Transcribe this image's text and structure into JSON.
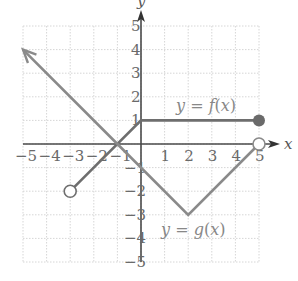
{
  "chart_data": {
    "type": "line",
    "title": "",
    "xlabel": "x",
    "ylabel": "y",
    "xlim": [
      -5,
      5
    ],
    "ylim": [
      -5,
      5
    ],
    "grid": true,
    "x_ticks": [
      "-5",
      "-4",
      "-3",
      "-2",
      "-1",
      "1",
      "2",
      "3",
      "4",
      "5"
    ],
    "y_ticks": [
      "5",
      "4",
      "3",
      "2",
      "1",
      "-1",
      "-2",
      "-3",
      "-4",
      "-5"
    ],
    "series": [
      {
        "name": "y = f(x)",
        "label_parts": [
          "y = ",
          "f",
          "(",
          "x",
          ")"
        ],
        "points": [
          [
            -3,
            -2
          ],
          [
            0,
            1
          ],
          [
            5,
            1
          ]
        ],
        "start_marker": "open-circle",
        "end_marker": "closed-circle",
        "color": "#6e6e6e"
      },
      {
        "name": "y = g(x)",
        "label_parts": [
          "y = ",
          "g",
          "(",
          "x",
          ")"
        ],
        "points": [
          [
            -5,
            4
          ],
          [
            -1,
            0
          ],
          [
            2,
            -3
          ],
          [
            5,
            0
          ]
        ],
        "start_marker": "arrow",
        "end_marker": "open-circle",
        "color": "#8a8a8a"
      }
    ]
  },
  "labels": {
    "x_axis": "x",
    "y_axis": "y",
    "f_label": "y = f(x)",
    "g_label": "y = g(x)"
  }
}
